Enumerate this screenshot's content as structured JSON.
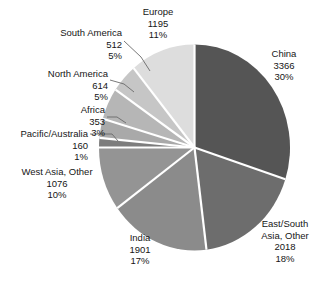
{
  "chart_data": {
    "type": "pie",
    "title": "",
    "subtitle": "",
    "xlabel": "",
    "ylabel": "",
    "legend_position": "none",
    "grid": false,
    "label_format": "name / value / percent",
    "total": 11195,
    "categories": [
      "China",
      "East/South Asia, Other",
      "India",
      "West Asia, Other",
      "Pacific/Australia",
      "Africa",
      "North America",
      "South America",
      "Europe"
    ],
    "values": [
      3366,
      2018,
      1901,
      1076,
      160,
      353,
      614,
      512,
      1195
    ],
    "percents": [
      30,
      18,
      17,
      10,
      1,
      3,
      5,
      5,
      11
    ],
    "colors": [
      "#555555",
      "#6d6d6d",
      "#8b8b8b",
      "#949494",
      "#7d7d7d",
      "#a9a9a9",
      "#b6b6b6",
      "#c6c6c6",
      "#dddddd"
    ],
    "slices": [
      {
        "name": "China",
        "value": "3366",
        "percent": "30%",
        "share": 30.0,
        "color": "#555555",
        "start_angle": 0,
        "end_angle": 108
      },
      {
        "name": "East/South Asia, Other",
        "name_line1": "East/South",
        "name_line2": "Asia, Other",
        "value": "2018",
        "percent": "18%",
        "share": 18.0,
        "color": "#6d6d6d",
        "start_angle": 108,
        "end_angle": 172.8
      },
      {
        "name": "India",
        "value": "1901",
        "percent": "17%",
        "share": 17.0,
        "color": "#8b8b8b",
        "start_angle": 172.8,
        "end_angle": 234
      },
      {
        "name": "West Asia, Other",
        "value": "1076",
        "percent": "10%",
        "share": 10.0,
        "color": "#949494",
        "start_angle": 234,
        "end_angle": 270
      },
      {
        "name": "Pacific/Australia",
        "value": "160",
        "percent": "1%",
        "share": 1.0,
        "color": "#7d7d7d",
        "start_angle": 270,
        "end_angle": 275.4
      },
      {
        "name": "Africa",
        "value": "353",
        "percent": "3%",
        "share": 3.0,
        "color": "#a9a9a9",
        "start_angle": 275.4,
        "end_angle": 286.2
      },
      {
        "name": "North America",
        "value": "614",
        "percent": "5%",
        "share": 5.0,
        "color": "#b6b6b6",
        "start_angle": 286.2,
        "end_angle": 304.2
      },
      {
        "name": "South America",
        "value": "512",
        "percent": "5%",
        "share": 5.0,
        "color": "#c6c6c6",
        "start_angle": 304.2,
        "end_angle": 320.4
      },
      {
        "name": "Europe",
        "value": "1195",
        "percent": "11%",
        "share": 11.0,
        "color": "#dddddd",
        "start_angle": 320.4,
        "end_angle": 360
      }
    ]
  },
  "labels": {
    "china": {
      "name": "China",
      "value": "3366",
      "percent": "30%"
    },
    "east_south": {
      "line1": "East/South",
      "line2": "Asia, Other",
      "value": "2018",
      "percent": "18%"
    },
    "india": {
      "name": "India",
      "value": "1901",
      "percent": "17%"
    },
    "west_asia": {
      "name": "West Asia, Other",
      "value": "1076",
      "percent": "10%"
    },
    "pacific": {
      "name": "Pacific/Australia",
      "value": "160",
      "percent": "1%"
    },
    "africa": {
      "name": "Africa",
      "value": "353",
      "percent": "3%"
    },
    "north_america": {
      "name": "North America",
      "value": "614",
      "percent": "5%"
    },
    "south_america": {
      "name": "South America",
      "value": "512",
      "percent": "5%"
    },
    "europe": {
      "name": "Europe",
      "value": "1195",
      "percent": "11%"
    }
  },
  "style": {
    "background": "#ffffff",
    "text_color": "#161616",
    "separator_color": "#ffffff",
    "leader_color": "#6a6a6a"
  }
}
